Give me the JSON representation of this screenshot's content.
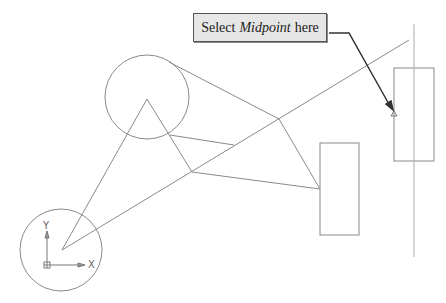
{
  "callout": {
    "prefix": "Select",
    "emphasis": "Midpoint",
    "suffix": "here"
  },
  "ucs_icon": {
    "x_label": "X",
    "y_label": "Y"
  },
  "colors": {
    "geometry": "#8a8a8a",
    "leader": "#333333",
    "callout_bg": "#e6e6e6"
  }
}
